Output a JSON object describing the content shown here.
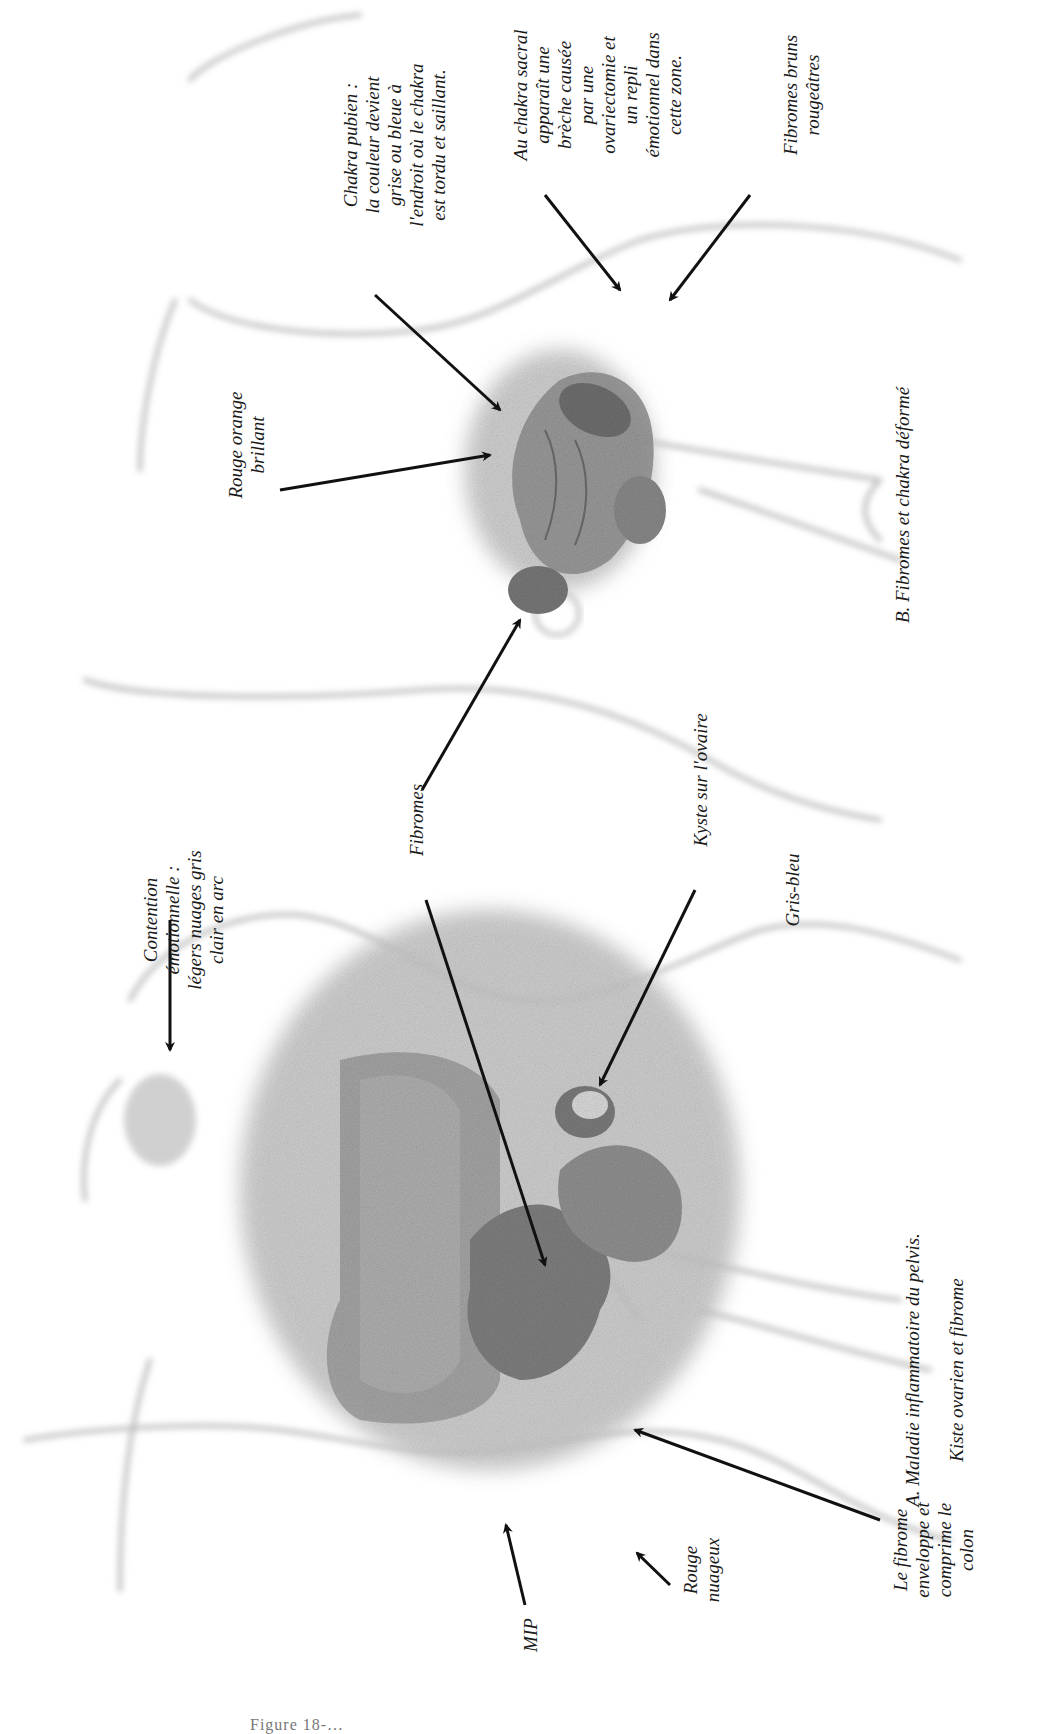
{
  "figure": {
    "orientation": "rotated-90",
    "partial_bottom_caption": "Figure 18-…",
    "panels": [
      {
        "id": "A",
        "caption_line1": "A. Maladie inflammatoire du pelvis.",
        "caption_line2": "Kiste ovarien et fibrome"
      },
      {
        "id": "B",
        "caption": "B. Fibromes et chakra déformé"
      }
    ],
    "labels": {
      "chakra_pubien": "Chakra pubien :\nla couleur devient\ngrise ou bleue à\nl'endroit où le chakra\nest tordu et saillant.",
      "chakra_sacral": "Au chakra sacral\napparaît une\nbrèche causée\npar une\novariectomie et\nun repli\némotionnel dans\ncette zone.",
      "fibromes_bruns": "Fibromes bruns\nrougeâtres",
      "rouge_orange": "Rouge orange\nbrillant",
      "fibromes": "Fibromes",
      "kyste": "Kyste sur l'ovaire",
      "gris_bleu": "Gris-bleu",
      "contention": "Contention\némotionnelle :\nlégers nuages gris\nclair en arc",
      "le_fibrome": "Le fibrome\nenveloppe et\ncomprime le\ncolon",
      "rouge_nuageux": "Rouge\nnuageux",
      "mip": "MIP"
    }
  }
}
